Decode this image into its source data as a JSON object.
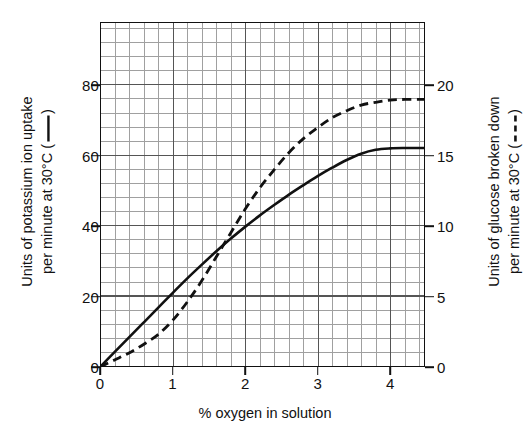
{
  "chart_data": {
    "type": "line",
    "title": "",
    "xlabel": "% oxygen in solution",
    "ylabel": "Units of potassium ion uptake per minute at 30°C ( —— )",
    "ylabel_right": "Units of glucose broken down per minute at 30°C ( - - - )",
    "ylabel_left_line1": "Units of potassium ion uptake",
    "ylabel_left_line2": "per minute at 30°C (",
    "ylabel_left_line2_end": ")",
    "ylabel_right_line1": "Units of glucose broken down",
    "ylabel_right_line2": "per minute at 30°C (",
    "ylabel_right_line2_end": ")",
    "xlim": [
      0,
      4.48
    ],
    "ylim": [
      0,
      98
    ],
    "ylim_right": [
      0,
      24.5
    ],
    "xticks": [
      0,
      1,
      2,
      3,
      4
    ],
    "xticklabels": [
      "0",
      "1",
      "2",
      "3",
      "4"
    ],
    "yticks": [
      0,
      20,
      40,
      60,
      80
    ],
    "yticklabels": [
      "0",
      "20",
      "40",
      "60",
      "80"
    ],
    "yticks_right": [
      0,
      5,
      10,
      15,
      20
    ],
    "yticklabels_right": [
      "0",
      "5",
      "10",
      "15",
      "20"
    ],
    "grid": true,
    "grid_minor_x": 0.2,
    "grid_minor_y": 4,
    "grid_major_x": 1,
    "grid_major_y": 20,
    "legend_position": "axis-labels",
    "line_color": "#111111",
    "series": [
      {
        "name": "Units of potassium ion uptake per minute at 30°C",
        "style": "solid",
        "axis": "left",
        "x": [
          0,
          0.2,
          0.4,
          0.6,
          0.8,
          1.0,
          1.2,
          1.4,
          1.6,
          1.8,
          2.0,
          2.2,
          2.4,
          2.6,
          2.8,
          3.0,
          3.2,
          3.4,
          3.6,
          3.8,
          4.0,
          4.2,
          4.48
        ],
        "values": [
          0,
          4.2,
          8.4,
          12.6,
          16.8,
          21.0,
          25.1,
          29.0,
          32.8,
          36.4,
          39.8,
          43.0,
          46.0,
          48.9,
          51.6,
          54.2,
          56.6,
          58.8,
          60.6,
          61.7,
          62.1,
          62.2,
          62.2
        ]
      },
      {
        "name": "Units of glucose broken down per minute at 30°C",
        "style": "dashed",
        "axis": "right",
        "x": [
          0,
          0.2,
          0.4,
          0.6,
          0.8,
          1.0,
          1.2,
          1.4,
          1.6,
          1.8,
          2.0,
          2.2,
          2.4,
          2.6,
          2.8,
          3.0,
          3.2,
          3.4,
          3.6,
          3.8,
          4.0,
          4.2,
          4.48
        ],
        "values": [
          0,
          0.5,
          1.0,
          1.6,
          2.3,
          3.3,
          4.6,
          6.1,
          7.8,
          9.5,
          11.2,
          12.7,
          14.0,
          15.2,
          16.2,
          17.0,
          17.7,
          18.2,
          18.6,
          18.8,
          18.95,
          19.0,
          19.0
        ]
      }
    ],
    "annotations": [
      {
        "text": "solid line refers to left-hand axis",
        "kind": "legend-in-axis-label"
      },
      {
        "text": "dashed line refers to right-hand axis",
        "kind": "legend-in-axis-label"
      }
    ]
  }
}
